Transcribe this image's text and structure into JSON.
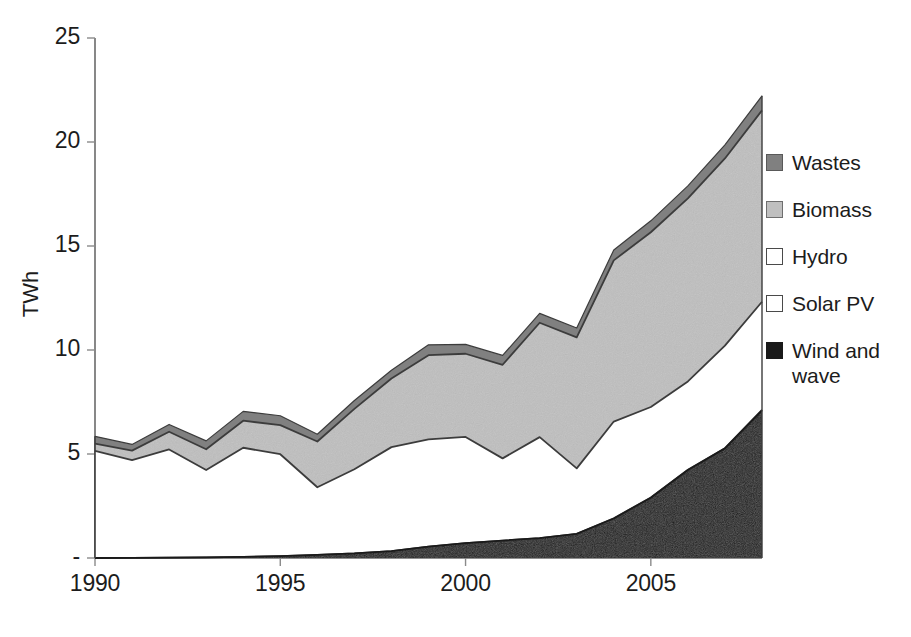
{
  "chart_data": {
    "type": "area",
    "stacked": true,
    "title": "",
    "subtitle": "",
    "xlabel": "",
    "ylabel": "TWh",
    "x": [
      1990,
      1991,
      1992,
      1993,
      1994,
      1995,
      1996,
      1997,
      1998,
      1999,
      2000,
      2001,
      2002,
      2003,
      2004,
      2005,
      2006,
      2007,
      2008
    ],
    "xlim": [
      1990,
      2008
    ],
    "ylim": [
      0,
      25
    ],
    "xticks": [
      1990,
      1995,
      2000,
      2005
    ],
    "xtick_labels": [
      "1990",
      "1995",
      "2000",
      "2005"
    ],
    "yticks": [
      0,
      5,
      10,
      15,
      20,
      25
    ],
    "ytick_labels": [
      "-",
      "5",
      "10",
      "15",
      "20",
      "25"
    ],
    "grid": false,
    "legend_position": "right",
    "stack_order_bottom_to_top": [
      "Wind and wave",
      "Solar PV",
      "Hydro",
      "Biomass",
      "Wastes"
    ],
    "series": [
      {
        "name": "Wind and wave",
        "color": "#1a1a1a",
        "values": [
          0.0,
          0.01,
          0.02,
          0.03,
          0.05,
          0.09,
          0.15,
          0.22,
          0.33,
          0.55,
          0.72,
          0.84,
          0.96,
          1.16,
          1.9,
          2.9,
          4.23,
          5.27,
          7.1
        ]
      },
      {
        "name": "Solar PV",
        "color": "#ffffff",
        "values": [
          0.0,
          0.0,
          0.0,
          0.0,
          0.0,
          0.0,
          0.0,
          0.0,
          0.0,
          0.0,
          0.0,
          0.0,
          0.0,
          0.0,
          0.01,
          0.01,
          0.01,
          0.01,
          0.02
        ]
      },
      {
        "name": "Hydro",
        "color": "#ffffff",
        "values": [
          5.15,
          4.7,
          5.2,
          4.2,
          5.25,
          4.9,
          3.25,
          4.05,
          5.0,
          5.15,
          5.1,
          3.95,
          4.85,
          3.15,
          4.65,
          4.35,
          4.25,
          4.93,
          5.2
        ]
      },
      {
        "name": "Biomass",
        "color": "#bfbfbf",
        "values": [
          0.35,
          0.45,
          0.85,
          1.0,
          1.3,
          1.4,
          2.2,
          2.9,
          3.3,
          4.05,
          4.0,
          4.5,
          5.5,
          6.3,
          7.75,
          8.4,
          8.8,
          9.0,
          9.2
        ]
      },
      {
        "name": "Wastes",
        "color": "#808080",
        "values": [
          0.35,
          0.3,
          0.35,
          0.4,
          0.45,
          0.45,
          0.35,
          0.4,
          0.4,
          0.5,
          0.45,
          0.45,
          0.45,
          0.45,
          0.5,
          0.55,
          0.6,
          0.65,
          0.7
        ]
      }
    ],
    "totals": [
      5.85,
      5.46,
      6.42,
      5.63,
      7.05,
      6.84,
      5.95,
      7.57,
      9.03,
      10.25,
      10.27,
      9.74,
      11.76,
      11.06,
      14.81,
      16.21,
      17.89,
      19.86,
      22.22
    ]
  },
  "legend": {
    "items": [
      {
        "label": "Wastes",
        "swatch": "swatch-dark-gray",
        "color": "#808080",
        "border": "#595959",
        "pattern": "solid"
      },
      {
        "label": "Biomass",
        "swatch": "swatch-light-gray",
        "color": "#bfbfbf",
        "border": "#6e6e6e",
        "pattern": "noise"
      },
      {
        "label": "Hydro",
        "swatch": "swatch-white",
        "color": "#ffffff",
        "border": "#4a4a4a",
        "pattern": "solid"
      },
      {
        "label": "Solar PV",
        "swatch": "swatch-white",
        "color": "#ffffff",
        "border": "#4a4a4a",
        "pattern": "solid"
      },
      {
        "label": "Wind and wave",
        "swatch": "swatch-black",
        "color": "#1a1a1a",
        "border": "#1a1a1a",
        "pattern": "solid"
      }
    ]
  },
  "axes": {
    "y_title": "TWh",
    "y_tick_labels": [
      "25",
      "20",
      "15",
      "10",
      "5",
      "-"
    ],
    "x_tick_labels": [
      "1990",
      "1995",
      "2000",
      "2005"
    ]
  },
  "caption": {
    "source": ""
  },
  "colors": {
    "axis_line": "#5a5a5a",
    "series_outline": "#3c3c3c",
    "text": "#1c1c1c",
    "background": "#ffffff"
  }
}
